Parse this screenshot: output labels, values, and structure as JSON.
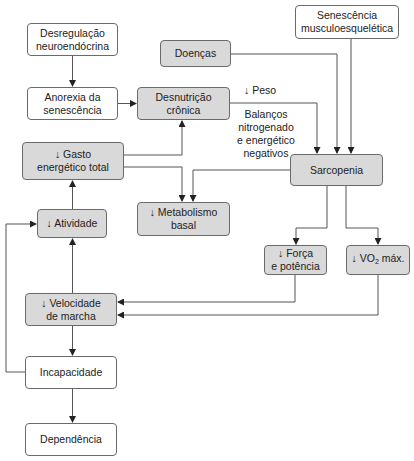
{
  "diagram": {
    "nodes": {
      "desregulacao": {
        "text": "Desregulação\nneuroendócrina",
        "style": "white"
      },
      "anorexia": {
        "text": "Anorexia da\nsenescência",
        "style": "white"
      },
      "doencas": {
        "text": "Doenças",
        "style": "gray"
      },
      "desnutricao": {
        "text": "Desnutrição\ncrônica",
        "style": "gray"
      },
      "senescencia": {
        "text": "Senescência\nmusculoesquelética",
        "style": "white"
      },
      "gasto": {
        "text": "↓ Gasto\nenergético total",
        "style": "gray"
      },
      "sarcopenia": {
        "text": "Sarcopenia",
        "style": "gray"
      },
      "atividade": {
        "text": "↓ Atividade",
        "style": "gray"
      },
      "metabolismo": {
        "text": "↓ Metabolismo\nbasal",
        "style": "gray"
      },
      "forca": {
        "text": "↓ Força\ne potência",
        "style": "gray"
      },
      "vo2_prefix": "↓ VO",
      "vo2_sub": "2",
      "vo2_suffix": " máx.",
      "velocidade": {
        "text": "↓ Velocidade\nde marcha",
        "style": "gray"
      },
      "incapacidade": {
        "text": "Incapacidade",
        "style": "white"
      },
      "dependencia": {
        "text": "Dependência",
        "style": "white"
      }
    },
    "edge_labels": {
      "peso": "↓ Peso",
      "balancos": "Balanços\nnitrogenado\ne energético\nnegativos"
    },
    "colors": {
      "gray_fill": "#d9d9d9",
      "white_fill": "#ffffff",
      "stroke": "#555555"
    },
    "edges": [
      {
        "from": "Desregulação neuroendócrina",
        "to": "Anorexia da senescência"
      },
      {
        "from": "Anorexia da senescência",
        "to": "Desnutrição crônica"
      },
      {
        "from": "↓ Gasto energético total",
        "to": "Desnutrição crônica"
      },
      {
        "from": "↓ Gasto energético total",
        "to": "↓ Metabolismo basal"
      },
      {
        "from": "Sarcopenia",
        "to": "↓ Metabolismo basal"
      },
      {
        "from": "Desnutrição crônica",
        "to": "Sarcopenia",
        "label": "↓ Peso / Balanços nitrogenado e energético negativos"
      },
      {
        "from": "Doenças",
        "to": "Sarcopenia"
      },
      {
        "from": "Senescência musculoesquelética",
        "to": "Sarcopenia"
      },
      {
        "from": "Sarcopenia",
        "to": "↓ Força e potência"
      },
      {
        "from": "Sarcopenia",
        "to": "↓ VO2 máx."
      },
      {
        "from": "↓ Força e potência",
        "to": "↓ Velocidade de marcha"
      },
      {
        "from": "↓ VO2 máx.",
        "to": "↓ Velocidade de marcha"
      },
      {
        "from": "↓ Atividade",
        "to": "↓ Gasto energético total"
      },
      {
        "from": "↓ Velocidade de marcha",
        "to": "↓ Atividade"
      },
      {
        "from": "↓ Velocidade de marcha",
        "to": "Incapacidade"
      },
      {
        "from": "Incapacidade",
        "to": "↓ Atividade"
      },
      {
        "from": "Incapacidade",
        "to": "Dependência"
      }
    ]
  }
}
